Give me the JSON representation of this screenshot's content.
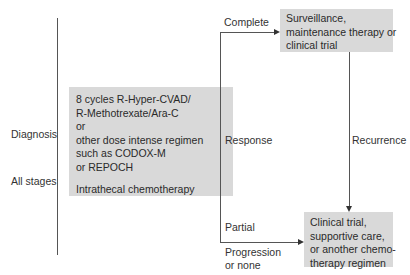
{
  "left_labels": {
    "diagnosis": "Diagnosis",
    "all_stages": "All stages"
  },
  "main_box": {
    "lines": [
      "8 cycles R-Hyper-CVAD/",
      "R-Methotrexate/Ara-C",
      "or",
      "other dose intense regimen",
      "such as CODOX-M",
      "or REPOCH"
    ],
    "intrathecal": "Intrathecal chemotherapy"
  },
  "branch_labels": {
    "complete": "Complete",
    "response": "Response",
    "partial": "Partial",
    "progression_line1": "Progression",
    "progression_line2": "or none",
    "recurrence": "Recurrence"
  },
  "surveillance_box": {
    "lines": [
      "Surveillance,",
      "maintenance therapy or",
      "clinical trial"
    ]
  },
  "clinical_box": {
    "lines": [
      "Clinical trial,",
      "supportive care,",
      "or another chemo-",
      "therapy regimen"
    ]
  },
  "colors": {
    "box_fill": "#d9d9d9",
    "line": "#555555"
  }
}
